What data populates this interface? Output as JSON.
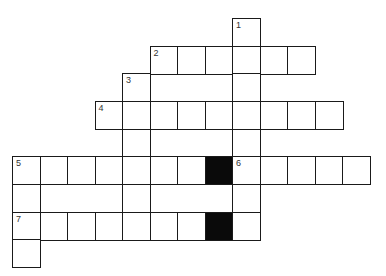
{
  "puzzle": {
    "type": "crossword",
    "grid_origin": {
      "x": 12,
      "y": 18
    },
    "cell_width": 27.5,
    "cell_height": 27.65,
    "colors": {
      "line": "#1a1a1a",
      "block": "#0a0a0a",
      "background": "#ffffff",
      "number": "#333333"
    },
    "cells": [
      {
        "r": 0,
        "c": 8,
        "num": "1"
      },
      {
        "r": 1,
        "c": 5,
        "num": "2"
      },
      {
        "r": 1,
        "c": 6
      },
      {
        "r": 1,
        "c": 7
      },
      {
        "r": 1,
        "c": 8
      },
      {
        "r": 1,
        "c": 9
      },
      {
        "r": 1,
        "c": 10
      },
      {
        "r": 2,
        "c": 4,
        "num": "3"
      },
      {
        "r": 2,
        "c": 8
      },
      {
        "r": 3,
        "c": 3,
        "num": "4"
      },
      {
        "r": 3,
        "c": 4
      },
      {
        "r": 3,
        "c": 5
      },
      {
        "r": 3,
        "c": 6
      },
      {
        "r": 3,
        "c": 7
      },
      {
        "r": 3,
        "c": 8
      },
      {
        "r": 3,
        "c": 9
      },
      {
        "r": 3,
        "c": 10
      },
      {
        "r": 3,
        "c": 11
      },
      {
        "r": 4,
        "c": 4
      },
      {
        "r": 4,
        "c": 8
      },
      {
        "r": 5,
        "c": 0,
        "num": "5"
      },
      {
        "r": 5,
        "c": 1
      },
      {
        "r": 5,
        "c": 2
      },
      {
        "r": 5,
        "c": 3
      },
      {
        "r": 5,
        "c": 4
      },
      {
        "r": 5,
        "c": 5
      },
      {
        "r": 5,
        "c": 6
      },
      {
        "r": 5,
        "c": 7,
        "block": true
      },
      {
        "r": 5,
        "c": 8,
        "num": "6"
      },
      {
        "r": 5,
        "c": 9
      },
      {
        "r": 5,
        "c": 10
      },
      {
        "r": 5,
        "c": 11
      },
      {
        "r": 5,
        "c": 12
      },
      {
        "r": 6,
        "c": 0
      },
      {
        "r": 6,
        "c": 4
      },
      {
        "r": 6,
        "c": 8
      },
      {
        "r": 7,
        "c": 0,
        "num": "7"
      },
      {
        "r": 7,
        "c": 1
      },
      {
        "r": 7,
        "c": 2
      },
      {
        "r": 7,
        "c": 3
      },
      {
        "r": 7,
        "c": 4
      },
      {
        "r": 7,
        "c": 5
      },
      {
        "r": 7,
        "c": 6
      },
      {
        "r": 7,
        "c": 7,
        "block": true
      },
      {
        "r": 7,
        "c": 8
      },
      {
        "r": 8,
        "c": 0
      }
    ],
    "clue_numbers": [
      "1",
      "2",
      "3",
      "4",
      "5",
      "6",
      "7"
    ]
  }
}
